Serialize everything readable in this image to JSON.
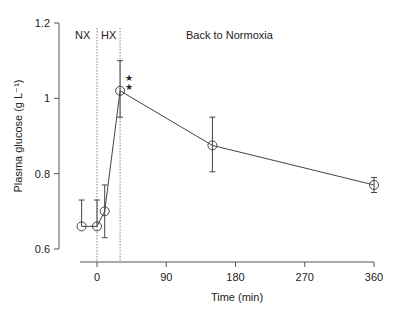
{
  "chart_data": {
    "type": "line",
    "title": "",
    "xlabel": "Time (min)",
    "ylabel": "Plasma glucose (g L⁻¹)",
    "xlim": [
      -22,
      360
    ],
    "ylim": [
      0.6,
      1.2
    ],
    "x_ticks": [
      0,
      90,
      180,
      270,
      360
    ],
    "y_ticks": [
      0.6,
      0.8,
      1.0,
      1.2
    ],
    "y_tick_labels": [
      "0.6",
      "0.8",
      "1",
      "1.2"
    ],
    "grid": false,
    "legend": null,
    "series": [
      {
        "name": "Plasma glucose",
        "marker": "open-circle",
        "x": [
          -20,
          0,
          10,
          30,
          150,
          360
        ],
        "values": [
          0.66,
          0.66,
          0.7,
          1.02,
          0.875,
          0.77
        ],
        "error_upper": [
          0.73,
          0.73,
          0.77,
          1.1,
          0.95,
          0.79
        ],
        "error_lower": [
          0.66,
          0.66,
          0.63,
          0.95,
          0.805,
          0.75
        ]
      }
    ],
    "phase_boundaries": [
      0,
      30
    ],
    "annotations": [
      {
        "text": "NX",
        "x": -12,
        "y": 1.17
      },
      {
        "text": "HX",
        "x": 15,
        "y": 1.17
      },
      {
        "text": "Back to Normoxia",
        "x": 140,
        "y": 1.17
      },
      {
        "text": "**",
        "x": 40,
        "y": 1.05,
        "meaning": "significance stars"
      }
    ]
  },
  "labels": {
    "xlabel": "Time (min)",
    "ylabel": "Plasma glucose (g L⁻¹)",
    "phase_nx": "NX",
    "phase_hx": "HX",
    "phase_back": "Back to Normoxia",
    "star": "★"
  },
  "colors": {
    "axis": "#555555",
    "line": "#444444",
    "text": "#222222"
  }
}
